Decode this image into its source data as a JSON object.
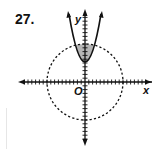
{
  "problem_number": "27.",
  "chart_data": {
    "type": "graph",
    "title": "",
    "xlabel": "x",
    "ylabel": "y",
    "origin_label": "O",
    "axis_range": {
      "x": [
        -17,
        17
      ],
      "y": [
        -17,
        18
      ]
    },
    "tick_interval": 1,
    "grid": false,
    "curves": [
      {
        "name": "parabola",
        "equation": "y = 0.7x^2 + 5",
        "style": "solid",
        "vertex": [
          0,
          5
        ]
      },
      {
        "name": "circle",
        "equation": "x^2 + y^2 = 100",
        "style": "dashed",
        "center": [
          0,
          0
        ],
        "radius": 10
      }
    ],
    "shaded_region": "inside circle and above parabola (y >= 0.7x^2 + 5, x^2 + y^2 <= 100)",
    "shade_color": "#b0b0b0"
  }
}
